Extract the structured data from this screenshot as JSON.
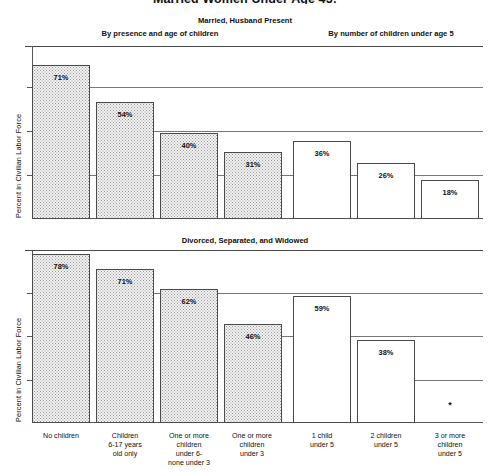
{
  "title": "Married Women Under Age 45:",
  "panels": [
    {
      "heading": "Married, Husband Present",
      "group_left": "By presence and age of children",
      "group_right": "By number of children under age 5",
      "ylabel": "Percent in Civilian Labor Force"
    },
    {
      "heading": "Divorced, Separated, and Widowed",
      "ylabel": "Percent in Civilian Labor Force"
    }
  ],
  "categories": [
    "No children",
    "Children\n6-17 years\nold only",
    "One or more\nchildren\nunder 6-\nnone under 3",
    "One or more\nchildren\nunder 3",
    "1 child\nunder 5",
    "2 children\nunder 5",
    "3 or more\nchildren\nunder 5"
  ],
  "category_lines": [
    [
      "No children"
    ],
    [
      "Children",
      "6-17 years",
      "old only"
    ],
    [
      "One or more",
      "children",
      "under 6-",
      "none under 3"
    ],
    [
      "One or more",
      "children",
      "under 3"
    ],
    [
      "1 child",
      "under 5"
    ],
    [
      "2 children",
      "under 5"
    ],
    [
      "3 or more",
      "children",
      "under 5"
    ]
  ],
  "labels": {
    "m71": "71%",
    "m54": "54%",
    "m40": "40%",
    "m31": "31%",
    "m36": "36%",
    "m26": "26%",
    "m18": "18%",
    "d78": "78%",
    "d71": "71%",
    "d62": "62%",
    "d46": "46%",
    "d59": "59%",
    "d38": "38%",
    "dNA": "*"
  },
  "colors": {
    "fill_stipple": "#f2f2f2",
    "fill_plain": "#ffffff",
    "line": "#4a4a4a",
    "text": "#111111"
  },
  "chart_data": [
    {
      "type": "bar",
      "title": "Married, Husband Present",
      "subtitle_left": "By presence and age of children",
      "subtitle_right": "By number of children under age 5",
      "xlabel": "",
      "ylabel": "Percent in Civilian Labor Force",
      "ylim": [
        0,
        80
      ],
      "yticks": [
        0,
        20,
        40,
        60
      ],
      "grid": true,
      "legend": "none",
      "categories": [
        "No children",
        "Children 6-17 years old only",
        "One or more children under 6 - none under 3",
        "One or more children under 3",
        "1 child under 5",
        "2 children under 5",
        "3 or more children under 5"
      ],
      "values": [
        71,
        54,
        40,
        31,
        36,
        26,
        18
      ],
      "data_labels": [
        "71%",
        "54%",
        "40%",
        "31%",
        "36%",
        "26%",
        "18%"
      ],
      "bar_styles": [
        "stippled",
        "stippled",
        "stippled",
        "stippled",
        "plain",
        "plain",
        "plain"
      ]
    },
    {
      "type": "bar",
      "title": "Divorced, Separated, and Widowed",
      "xlabel": "",
      "ylabel": "Percent in Civilian Labor Force",
      "ylim": [
        0,
        80
      ],
      "yticks": [
        0,
        20,
        40,
        60
      ],
      "grid": true,
      "legend": "none",
      "categories": [
        "No children",
        "Children 6-17 years old only",
        "One or more children under 6 - none under 3",
        "One or more children under 3",
        "1 child under 5",
        "2 children under 5",
        "3 or more children under 5"
      ],
      "values": [
        78,
        71,
        62,
        46,
        59,
        38,
        null
      ],
      "data_labels": [
        "78%",
        "71%",
        "62%",
        "46%",
        "59%",
        "38%",
        "*"
      ],
      "bar_styles": [
        "stippled",
        "stippled",
        "stippled",
        "stippled",
        "plain",
        "plain",
        "plain"
      ],
      "notes": "Last category value not shown (asterisk)"
    }
  ]
}
